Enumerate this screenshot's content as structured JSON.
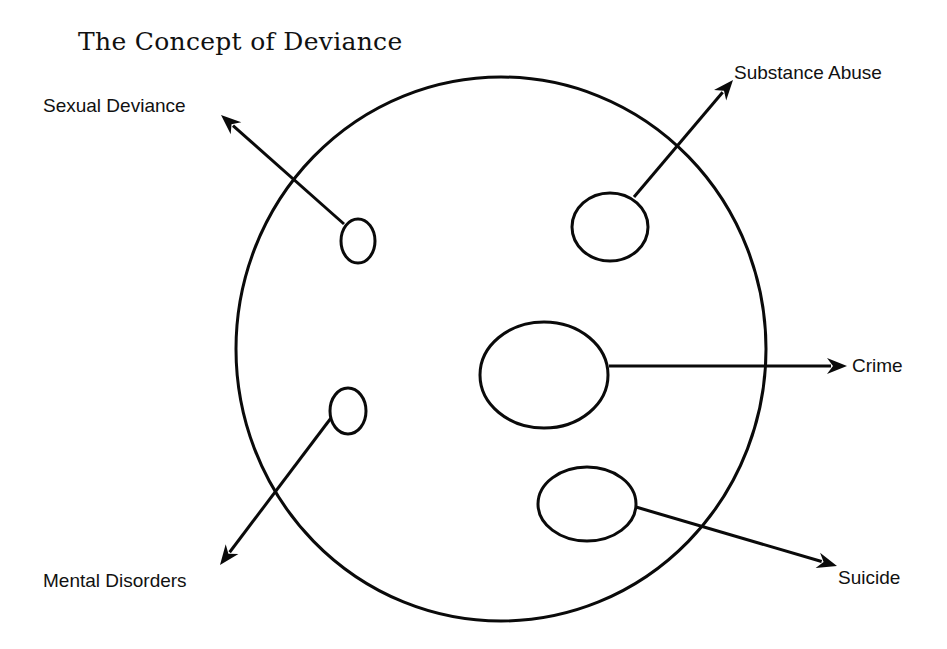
{
  "title": "The Concept of Deviance",
  "colors": {
    "background": "#ffffff",
    "ink": "#0a0a0a"
  },
  "domain_circle": {
    "label": "Deviance",
    "cx": 501,
    "cy": 349,
    "rx": 265,
    "ry": 272
  },
  "categories": [
    {
      "id": "sexual-deviance",
      "label": "Sexual Deviance",
      "ellipse": {
        "cx": 358,
        "cy": 241,
        "rx": 17,
        "ry": 22
      },
      "arrow": {
        "from": [
          344,
          224
        ],
        "to": [
          221,
          115
        ]
      }
    },
    {
      "id": "substance-abuse",
      "label": "Substance Abuse",
      "ellipse": {
        "cx": 610,
        "cy": 227,
        "rx": 38,
        "ry": 34
      },
      "arrow": {
        "from": [
          634,
          197
        ],
        "to": [
          733,
          80
        ]
      }
    },
    {
      "id": "crime",
      "label": "Crime",
      "ellipse": {
        "cx": 544,
        "cy": 375,
        "rx": 64,
        "ry": 53
      },
      "arrow": {
        "from": [
          609,
          366
        ],
        "to": [
          847,
          366
        ]
      }
    },
    {
      "id": "mental-disorders",
      "label": "Mental Disorders",
      "ellipse": {
        "cx": 348,
        "cy": 411,
        "rx": 18,
        "ry": 23
      },
      "arrow": {
        "from": [
          331,
          418
        ],
        "to": [
          220,
          565
        ]
      }
    },
    {
      "id": "suicide",
      "label": "Suicide",
      "ellipse": {
        "cx": 587,
        "cy": 504,
        "rx": 49,
        "ry": 37
      },
      "arrow": {
        "from": [
          636,
          507
        ],
        "to": [
          837,
          566
        ]
      }
    }
  ]
}
